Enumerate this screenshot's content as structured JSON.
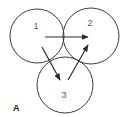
{
  "diagram": {
    "panel_label": "A",
    "nodes": [
      {
        "id": "1",
        "label": "1",
        "cx": 37,
        "cy": 36,
        "r": 27
      },
      {
        "id": "2",
        "label": "2",
        "cx": 91,
        "cy": 36,
        "r": 28
      },
      {
        "id": "3",
        "label": "3",
        "cx": 65,
        "cy": 85,
        "r": 28
      }
    ],
    "edges": [
      {
        "from": "1",
        "to": "2"
      },
      {
        "from": "1",
        "to": "3"
      },
      {
        "from": "3",
        "to": "2"
      }
    ],
    "colors": {
      "stroke": "#3a3a3a",
      "text": "#555555",
      "background": "#ffffff"
    }
  }
}
